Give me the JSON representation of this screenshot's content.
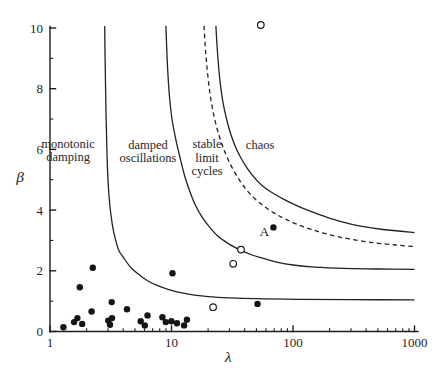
{
  "figure": {
    "background": "#ffffff",
    "ink_color": "#1e1e1e"
  },
  "chart_data": {
    "type": "scatter",
    "title": "",
    "xlabel": "λ",
    "ylabel": "β",
    "xscale": "log",
    "yscale": "linear",
    "xlim": [
      1,
      1000
    ],
    "ylim": [
      0,
      10
    ],
    "grid": false,
    "legend": "none",
    "x_major_ticks": [
      {
        "value": 1,
        "label": "1"
      },
      {
        "value": 10,
        "label": "10"
      },
      {
        "value": 100,
        "label": "100"
      },
      {
        "value": 1000,
        "label": "1000"
      }
    ],
    "y_major_ticks": [
      {
        "value": 0,
        "label": "0"
      },
      {
        "value": 2,
        "label": "2"
      },
      {
        "value": 4,
        "label": "4"
      },
      {
        "value": 6,
        "label": "6"
      },
      {
        "value": 8,
        "label": "8"
      },
      {
        "value": 10,
        "label": "10"
      }
    ],
    "y_minor_ticks": [
      1,
      3,
      5,
      7,
      9
    ],
    "regions": [
      {
        "id": "monotonic-damping",
        "lines": [
          "monotonic",
          "damping"
        ],
        "x": 1.41,
        "y": 5.97
      },
      {
        "id": "damped-oscillations",
        "lines": [
          "damped",
          "oscillations"
        ],
        "x": 6.4,
        "y": 5.94
      },
      {
        "id": "stable-limit-cycles",
        "lines": [
          "stable",
          "limit",
          "cycles"
        ],
        "x": 19.6,
        "y": 5.73
      },
      {
        "id": "chaos",
        "lines": [
          "chaos"
        ],
        "x": 53.6,
        "y": 6.14
      }
    ],
    "boundary_curves": [
      {
        "id": "monotonic-oscillatory",
        "style": "solid",
        "points": [
          [
            2.82,
            10.07
          ],
          [
            2.85,
            8.6
          ],
          [
            2.89,
            7.2
          ],
          [
            2.94,
            6.0
          ],
          [
            3.0,
            5.0
          ],
          [
            3.1,
            4.2
          ],
          [
            3.25,
            3.55
          ],
          [
            3.45,
            3.05
          ],
          [
            3.7,
            2.66
          ],
          [
            4.05,
            2.42
          ],
          [
            4.6,
            2.12
          ],
          [
            5.3,
            1.9
          ],
          [
            6.3,
            1.68
          ],
          [
            7.7,
            1.51
          ],
          [
            9.5,
            1.38
          ],
          [
            12,
            1.28
          ],
          [
            15.5,
            1.2
          ],
          [
            20,
            1.15
          ],
          [
            30,
            1.11
          ],
          [
            50,
            1.08
          ],
          [
            110,
            1.06
          ],
          [
            300,
            1.05
          ],
          [
            1000,
            1.04
          ]
        ]
      },
      {
        "id": "oscillatory-limit-cycle",
        "style": "solid",
        "points": [
          [
            9.0,
            10.07
          ],
          [
            9.25,
            8.8
          ],
          [
            9.6,
            7.8
          ],
          [
            10.1,
            7.0
          ],
          [
            10.9,
            6.3
          ],
          [
            11.8,
            5.7
          ],
          [
            12.9,
            5.1
          ],
          [
            14.2,
            4.6
          ],
          [
            15.8,
            4.15
          ],
          [
            17.8,
            3.78
          ],
          [
            20.5,
            3.45
          ],
          [
            24,
            3.15
          ],
          [
            28.5,
            2.93
          ],
          [
            33,
            2.78
          ],
          [
            38,
            2.66
          ],
          [
            46,
            2.52
          ],
          [
            58,
            2.4
          ],
          [
            75,
            2.28
          ],
          [
            100,
            2.19
          ],
          [
            150,
            2.12
          ],
          [
            260,
            2.08
          ],
          [
            500,
            2.06
          ],
          [
            1000,
            2.05
          ]
        ]
      },
      {
        "id": "limit-cycle-chaos",
        "style": "solid",
        "points": [
          [
            23.2,
            10.07
          ],
          [
            24,
            9.1
          ],
          [
            25,
            8.3
          ],
          [
            26.4,
            7.6
          ],
          [
            28.2,
            7.05
          ],
          [
            30.5,
            6.55
          ],
          [
            33.5,
            6.1
          ],
          [
            37.5,
            5.7
          ],
          [
            42.5,
            5.35
          ],
          [
            49,
            5.03
          ],
          [
            57,
            4.78
          ],
          [
            67,
            4.58
          ],
          [
            82,
            4.38
          ],
          [
            103,
            4.18
          ],
          [
            135,
            3.98
          ],
          [
            180,
            3.8
          ],
          [
            250,
            3.62
          ],
          [
            360,
            3.47
          ],
          [
            550,
            3.36
          ],
          [
            1000,
            3.26
          ]
        ]
      },
      {
        "id": "dashed-boundary",
        "style": "dashed",
        "points": [
          [
            18.5,
            10.07
          ],
          [
            19.2,
            9.1
          ],
          [
            20.2,
            8.2
          ],
          [
            21.5,
            7.45
          ],
          [
            23.3,
            6.8
          ],
          [
            25.6,
            6.25
          ],
          [
            28.4,
            5.78
          ],
          [
            32,
            5.35
          ],
          [
            36.5,
            4.97
          ],
          [
            42,
            4.64
          ],
          [
            49,
            4.36
          ],
          [
            58,
            4.12
          ],
          [
            70,
            3.9
          ],
          [
            87,
            3.7
          ],
          [
            110,
            3.52
          ],
          [
            145,
            3.35
          ],
          [
            200,
            3.19
          ],
          [
            290,
            3.05
          ],
          [
            450,
            2.93
          ],
          [
            700,
            2.85
          ],
          [
            1000,
            2.8
          ]
        ]
      }
    ],
    "filled_points": [
      [
        1.29,
        0.14
      ],
      [
        1.58,
        0.31
      ],
      [
        1.68,
        0.44
      ],
      [
        1.84,
        0.25
      ],
      [
        1.76,
        1.46
      ],
      [
        2.25,
        2.1
      ],
      [
        2.2,
        0.66
      ],
      [
        3.02,
        0.36
      ],
      [
        3.12,
        0.22
      ],
      [
        3.24,
        0.44
      ],
      [
        3.22,
        0.97
      ],
      [
        4.3,
        0.73
      ],
      [
        5.58,
        0.34
      ],
      [
        6.03,
        0.2
      ],
      [
        6.34,
        0.53
      ],
      [
        8.42,
        0.47
      ],
      [
        8.98,
        0.31
      ],
      [
        9.99,
        0.34
      ],
      [
        10.2,
        1.92
      ],
      [
        11.1,
        0.27
      ],
      [
        12.7,
        0.2
      ],
      [
        13.4,
        0.39
      ],
      [
        51,
        0.91
      ],
      [
        69,
        3.43
      ]
    ],
    "open_points": [
      [
        54.3,
        10.1
      ],
      [
        37.3,
        2.7
      ],
      [
        32.2,
        2.23
      ],
      [
        22,
        0.8
      ]
    ],
    "annotations": [
      {
        "text": "A",
        "x": 58,
        "y": 3.3
      }
    ]
  }
}
